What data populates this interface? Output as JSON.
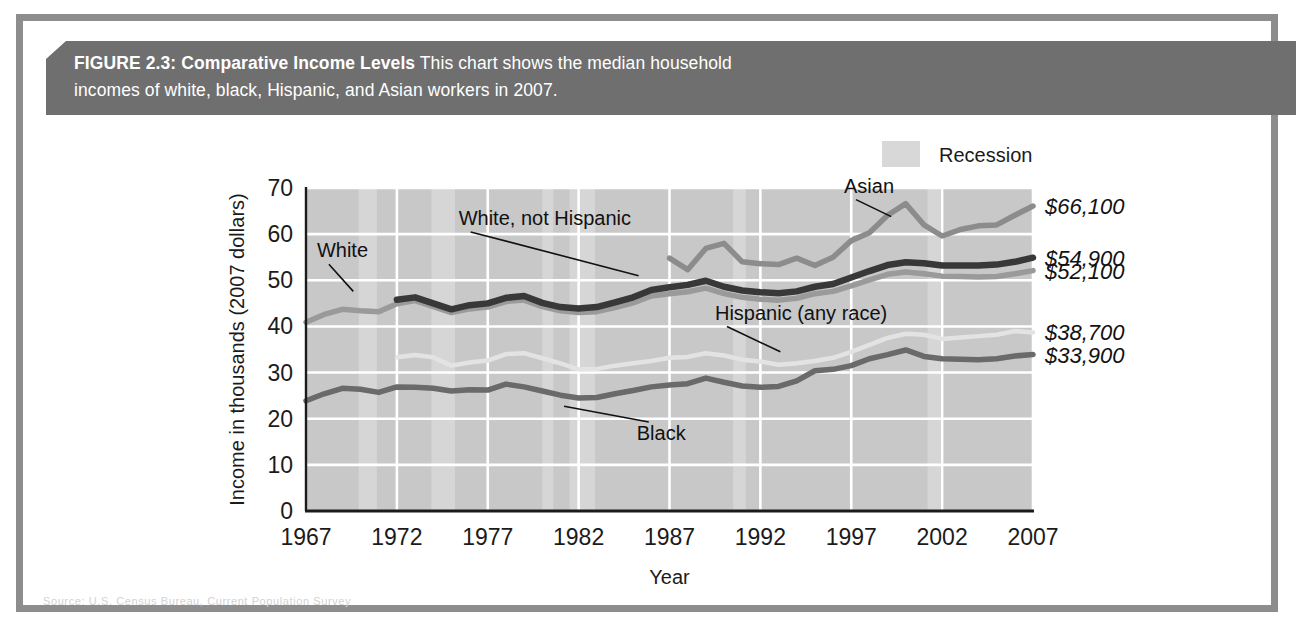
{
  "figure": {
    "caption_label": "FIGURE 2.3: Comparative Income Levels",
    "caption_text_line1": " This chart shows the median household",
    "caption_text_line2": "incomes of white, black, Hispanic, and Asian workers in 2007.",
    "note": "Note: Income rounded to nearest $100.",
    "source": "Source: U.S. Census Bureau, Current Population Survey",
    "banner_color": "#6f6f6f",
    "frame_color": "#8d8d8d",
    "plot_background": "#c8c8c8"
  },
  "legend": {
    "position": "top-right",
    "items": [
      {
        "label": "Recession",
        "swatch": "#d8d8d8",
        "icon": "recession-swatch"
      }
    ]
  },
  "chart_data": {
    "type": "line",
    "title": "Comparative Income Levels",
    "xlabel": "Year",
    "ylabel": "Income in thousands (2007 dollars)",
    "xlim": [
      1967,
      2007
    ],
    "ylim": [
      0,
      70
    ],
    "ytick_values": [
      0,
      10,
      20,
      30,
      40,
      50,
      60,
      70
    ],
    "ytick_labels": [
      "0",
      "10",
      "20",
      "30",
      "40",
      "50",
      "60",
      "70"
    ],
    "xtick_values": [
      1967,
      1972,
      1977,
      1982,
      1987,
      1992,
      1997,
      2002,
      2007
    ],
    "xtick_labels": [
      "1967",
      "1972",
      "1977",
      "1982",
      "1987",
      "1992",
      "1997",
      "2002",
      "2007"
    ],
    "grid": true,
    "units": "thousands of 2007 dollars",
    "recession_bands": [
      [
        1969.9,
        1970.9
      ],
      [
        1973.9,
        1975.2
      ],
      [
        1980.0,
        1980.6
      ],
      [
        1981.5,
        1982.9
      ],
      [
        1990.5,
        1991.2
      ],
      [
        2001.2,
        2001.9
      ]
    ],
    "series": [
      {
        "name": "Asian",
        "key": "asian",
        "color": "#8c8c8c",
        "width": 5.5,
        "label": "Asian",
        "end_label": "$66,100",
        "end_value": 66.1,
        "x": [
          1987,
          1988,
          1989,
          1990,
          1991,
          1992,
          1993,
          1994,
          1995,
          1996,
          1997,
          1998,
          1999,
          2000,
          2001,
          2002,
          2003,
          2004,
          2005,
          2006,
          2007
        ],
        "y": [
          54.8,
          52.3,
          56.9,
          58.0,
          54.0,
          53.6,
          53.4,
          54.8,
          53.2,
          55.0,
          58.6,
          60.3,
          64.1,
          66.6,
          62.0,
          59.6,
          61.0,
          61.8,
          62.0,
          64.1,
          66.1
        ]
      },
      {
        "name": "White, not Hispanic",
        "key": "white_not_hispanic",
        "color": "#383838",
        "width": 6.5,
        "label": "White, not Hispanic",
        "end_label": "$54,900",
        "end_value": 54.9,
        "x": [
          1972,
          1973,
          1974,
          1975,
          1976,
          1977,
          1978,
          1979,
          1980,
          1981,
          1982,
          1983,
          1984,
          1985,
          1986,
          1987,
          1988,
          1989,
          1990,
          1991,
          1992,
          1993,
          1994,
          1995,
          1996,
          1997,
          1998,
          1999,
          2000,
          2001,
          2002,
          2003,
          2004,
          2005,
          2006,
          2007
        ],
        "y": [
          45.8,
          46.3,
          45.0,
          43.7,
          44.6,
          45.0,
          46.2,
          46.6,
          45.1,
          44.2,
          43.9,
          44.2,
          45.2,
          46.3,
          47.9,
          48.5,
          49.0,
          49.9,
          48.6,
          47.8,
          47.4,
          47.2,
          47.6,
          48.6,
          49.2,
          50.6,
          52.0,
          53.3,
          53.9,
          53.7,
          53.2,
          53.2,
          53.2,
          53.4,
          54.0,
          54.9
        ]
      },
      {
        "name": "White",
        "key": "white",
        "color": "#9a9a9a",
        "width": 5.5,
        "label": "White",
        "end_label": "$52,100",
        "end_value": 52.1,
        "x": [
          1967,
          1968,
          1969,
          1970,
          1971,
          1972,
          1973,
          1974,
          1975,
          1976,
          1977,
          1978,
          1979,
          1980,
          1981,
          1982,
          1983,
          1984,
          1985,
          1986,
          1987,
          1988,
          1989,
          1990,
          1991,
          1992,
          1993,
          1994,
          1995,
          1996,
          1997,
          1998,
          1999,
          2000,
          2001,
          2002,
          2003,
          2004,
          2005,
          2006,
          2007
        ],
        "y": [
          40.9,
          42.6,
          43.7,
          43.4,
          43.2,
          44.9,
          45.6,
          44.3,
          43.0,
          43.8,
          44.2,
          45.4,
          45.7,
          44.3,
          43.4,
          43.0,
          43.2,
          44.1,
          45.1,
          46.6,
          47.1,
          47.5,
          48.3,
          47.1,
          46.3,
          45.9,
          45.7,
          46.1,
          47.1,
          47.6,
          48.8,
          50.1,
          51.3,
          51.8,
          51.4,
          50.9,
          50.8,
          50.7,
          50.8,
          51.4,
          52.1
        ]
      },
      {
        "name": "Hispanic (any race)",
        "key": "hispanic",
        "color": "#e3e3e3",
        "width": 4.5,
        "label": "Hispanic (any race)",
        "end_label": "$38,700",
        "end_value": 38.7,
        "x": [
          1972,
          1973,
          1974,
          1975,
          1976,
          1977,
          1978,
          1979,
          1980,
          1981,
          1982,
          1983,
          1984,
          1985,
          1986,
          1987,
          1988,
          1989,
          1990,
          1991,
          1992,
          1993,
          1994,
          1995,
          1996,
          1997,
          1998,
          1999,
          2000,
          2001,
          2002,
          2003,
          2004,
          2005,
          2006,
          2007
        ],
        "y": [
          33.3,
          33.8,
          33.3,
          31.5,
          32.2,
          32.6,
          34.0,
          34.2,
          33.1,
          32.0,
          30.7,
          30.8,
          31.5,
          32.0,
          32.5,
          33.2,
          33.4,
          34.2,
          33.7,
          32.8,
          32.4,
          31.7,
          32.0,
          32.5,
          33.2,
          34.5,
          36.0,
          37.5,
          38.4,
          38.2,
          37.3,
          37.6,
          37.9,
          38.2,
          39.0,
          38.7
        ]
      },
      {
        "name": "Black",
        "key": "black",
        "color": "#6a6a6a",
        "width": 5.5,
        "label": "Black",
        "end_label": "$33,900",
        "end_value": 33.9,
        "x": [
          1967,
          1968,
          1969,
          1970,
          1971,
          1972,
          1973,
          1974,
          1975,
          1976,
          1977,
          1978,
          1979,
          1980,
          1981,
          1982,
          1983,
          1984,
          1985,
          1986,
          1987,
          1988,
          1989,
          1990,
          1991,
          1992,
          1993,
          1994,
          1995,
          1996,
          1997,
          1998,
          1999,
          2000,
          2001,
          2002,
          2003,
          2004,
          2005,
          2006,
          2007
        ],
        "y": [
          23.9,
          25.4,
          26.6,
          26.4,
          25.7,
          26.9,
          26.8,
          26.6,
          26.0,
          26.3,
          26.2,
          27.5,
          26.9,
          26.0,
          25.1,
          24.5,
          24.6,
          25.4,
          26.1,
          26.9,
          27.3,
          27.6,
          28.8,
          27.9,
          27.1,
          26.8,
          27.0,
          28.2,
          30.4,
          30.7,
          31.5,
          33.0,
          33.9,
          34.9,
          33.5,
          33.0,
          32.9,
          32.8,
          33.0,
          33.6,
          33.9
        ]
      }
    ],
    "annotations": [
      {
        "text": "Asian",
        "for": "asian",
        "tx": 1996.6,
        "ty": 69.0,
        "lx": 1999.2,
        "ly": 63.8
      },
      {
        "text": "White, not Hispanic",
        "for": "white_not_hispanic",
        "tx": 1975.4,
        "ty": 62.0,
        "lx": 1985.3,
        "ly": 51.0
      },
      {
        "text": "White",
        "for": "white",
        "tx": 1967.6,
        "ty": 55.0,
        "lx": 1969.6,
        "ly": 47.6
      },
      {
        "text": "Hispanic (any race)",
        "for": "hispanic",
        "tx": 1989.5,
        "ty": 41.5,
        "lx": 1993.1,
        "ly": 34.5
      },
      {
        "text": "Black",
        "for": "black",
        "tx": 1985.2,
        "ty": 15.4,
        "lx": 1981.2,
        "ly": 22.7
      }
    ]
  }
}
